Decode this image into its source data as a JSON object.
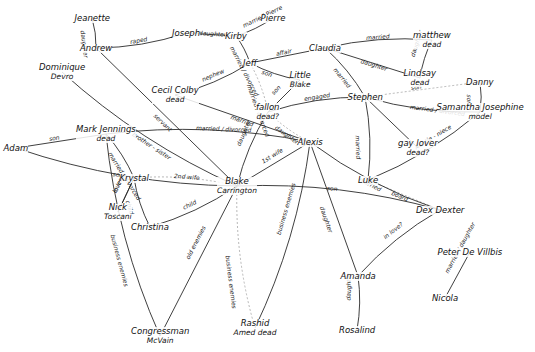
{
  "diagram": {
    "type": "hand-drawn relationship map",
    "nodes": [
      {
        "id": "jeanette",
        "label": "Jeanette",
        "x": 92,
        "y": 18
      },
      {
        "id": "andrew",
        "label": "Andrew",
        "x": 96,
        "y": 48
      },
      {
        "id": "dominique",
        "label": "Dominique",
        "sub": "Devro",
        "x": 62,
        "y": 72
      },
      {
        "id": "joseph",
        "label": "Joseph",
        "x": 186,
        "y": 33
      },
      {
        "id": "kirby",
        "label": "Kirby",
        "x": 236,
        "y": 36
      },
      {
        "id": "pierre",
        "label": "Pierre",
        "x": 273,
        "y": 18
      },
      {
        "id": "jeff",
        "label": "Jeff",
        "x": 250,
        "y": 63
      },
      {
        "id": "claudia",
        "label": "Claudia",
        "x": 325,
        "y": 48
      },
      {
        "id": "little_blake",
        "label": "Little",
        "sub": "Blake",
        "x": 300,
        "y": 80
      },
      {
        "id": "matthew",
        "label": "matthew",
        "sub": "dead",
        "x": 432,
        "y": 40
      },
      {
        "id": "lindsay",
        "label": "Lindsay",
        "sub": "dead",
        "x": 420,
        "y": 78
      },
      {
        "id": "danny",
        "label": "Danny",
        "x": 480,
        "y": 82
      },
      {
        "id": "samantha",
        "label": "Samantha Josephine",
        "sub": "model",
        "x": 480,
        "y": 112
      },
      {
        "id": "cecil",
        "label": "Cecil Colby",
        "sub": "dead",
        "x": 175,
        "y": 95
      },
      {
        "id": "fallon",
        "label": "fallon",
        "sub": "dead?",
        "x": 268,
        "y": 112
      },
      {
        "id": "stephen",
        "label": "Stephen",
        "x": 365,
        "y": 97
      },
      {
        "id": "gay_lover",
        "label": "gay lover",
        "sub": "dead?",
        "x": 418,
        "y": 148
      },
      {
        "id": "adam",
        "label": "Adam",
        "x": 16,
        "y": 148
      },
      {
        "id": "mark",
        "label": "Mark Jennings",
        "sub": "dead",
        "x": 106,
        "y": 134
      },
      {
        "id": "alexis",
        "label": "Alexis",
        "x": 310,
        "y": 142
      },
      {
        "id": "krystal",
        "label": "Krystal",
        "x": 134,
        "y": 178
      },
      {
        "id": "nick",
        "label": "Nick",
        "sub": "Toscani",
        "x": 118,
        "y": 212
      },
      {
        "id": "blake",
        "label": "Blake",
        "sub": "Carrington",
        "x": 237,
        "y": 186
      },
      {
        "id": "luke",
        "label": "Luke",
        "x": 368,
        "y": 180
      },
      {
        "id": "dex",
        "label": "Dex Dexter",
        "x": 440,
        "y": 210
      },
      {
        "id": "christina",
        "label": "Christina",
        "x": 150,
        "y": 227
      },
      {
        "id": "peter",
        "label": "Peter De Villbis",
        "x": 470,
        "y": 252
      },
      {
        "id": "nicola",
        "label": "Nicola",
        "x": 445,
        "y": 298
      },
      {
        "id": "amanda",
        "label": "Amanda",
        "x": 358,
        "y": 276
      },
      {
        "id": "rosalind",
        "label": "Rosalind",
        "x": 357,
        "y": 330
      },
      {
        "id": "rashid",
        "label": "Rashid",
        "sub": "Amed\ndead",
        "x": 255,
        "y": 328
      },
      {
        "id": "congressman",
        "label": "Congressman",
        "sub": "McVain",
        "x": 160,
        "y": 336
      }
    ],
    "edges": [
      {
        "from": "jeanette",
        "to": "andrew",
        "label": "daughter"
      },
      {
        "from": "joseph",
        "to": "kirby",
        "label": "daughter"
      },
      {
        "from": "kirby",
        "to": "pierre",
        "label": "married Pierre"
      },
      {
        "from": "kirby",
        "to": "jeff",
        "label": "married / divorced"
      },
      {
        "from": "jeff",
        "to": "claudia",
        "label": "affair"
      },
      {
        "from": "jeff",
        "to": "little_blake",
        "label": "son"
      },
      {
        "from": "jeff",
        "to": "fallon",
        "label": "married / divorced"
      },
      {
        "from": "fallon",
        "to": "little_blake",
        "label": "son"
      },
      {
        "from": "cecil",
        "to": "jeff",
        "label": "nephew"
      },
      {
        "from": "claudia",
        "to": "matthew",
        "label": "married"
      },
      {
        "from": "claudia",
        "to": "lindsay",
        "label": "daughter"
      },
      {
        "from": "matthew",
        "to": "lindsay",
        "label": "daughter"
      },
      {
        "from": "claudia",
        "to": "stephen",
        "label": "married"
      },
      {
        "from": "stephen",
        "to": "danny",
        "label": "son"
      },
      {
        "from": "stephen",
        "to": "samantha",
        "label": "married / divorced"
      },
      {
        "from": "danny",
        "to": "samantha",
        "label": "son"
      },
      {
        "from": "stephen",
        "to": "gay_lover",
        "label": ""
      },
      {
        "from": "luke",
        "to": "samantha",
        "label": "Auntie - niece"
      },
      {
        "from": "fallon",
        "to": "stephen",
        "label": "engaged"
      },
      {
        "from": "cecil",
        "to": "alexis",
        "label": "married"
      },
      {
        "from": "fallon",
        "to": "alexis",
        "label": "daughter"
      },
      {
        "from": "joseph",
        "to": "andrew",
        "label": "raped"
      },
      {
        "from": "andrew",
        "to": "blake",
        "label": "servant"
      },
      {
        "from": "dominique",
        "to": "blake",
        "label": "brother - sister"
      },
      {
        "from": "mark",
        "to": "alexis",
        "label": "married / divorced"
      },
      {
        "from": "adam",
        "to": "mark",
        "label": "son"
      },
      {
        "from": "adam",
        "to": "blake",
        "label": "son"
      },
      {
        "from": "krystal",
        "to": "blake",
        "label": "2nd wife"
      },
      {
        "from": "nick",
        "to": "krystal",
        "label": "in love"
      },
      {
        "from": "krystal",
        "to": "christina",
        "label": "child"
      },
      {
        "from": "blake",
        "to": "christina",
        "label": "child"
      },
      {
        "from": "alexis",
        "to": "blake",
        "label": "1st wife"
      },
      {
        "from": "fallon",
        "to": "blake",
        "label": "daughter"
      },
      {
        "from": "stephen",
        "to": "luke",
        "label": "married"
      },
      {
        "from": "luke",
        "to": "dex",
        "label": "board"
      },
      {
        "from": "alexis",
        "to": "dex",
        "label": "married"
      },
      {
        "from": "blake",
        "to": "dex",
        "label": "son"
      },
      {
        "from": "alexis",
        "to": "amanda",
        "label": "daughter"
      },
      {
        "from": "dex",
        "to": "amanda",
        "label": "in love?"
      },
      {
        "from": "amanda",
        "to": "rosalind",
        "label": "daughter"
      },
      {
        "from": "peter",
        "to": "nicola",
        "label": "married / daughter"
      },
      {
        "from": "blake",
        "to": "rashid",
        "label": "business enemies"
      },
      {
        "from": "alexis",
        "to": "rashid",
        "label": "business enemies"
      },
      {
        "from": "blake",
        "to": "congressman",
        "label": "old enemies"
      },
      {
        "from": "mark",
        "to": "congressman",
        "label": "business enemies"
      },
      {
        "from": "mark",
        "to": "krystal",
        "label": "married / divorced"
      },
      {
        "from": "krystal",
        "to": "nick",
        "label": "lover"
      }
    ]
  }
}
